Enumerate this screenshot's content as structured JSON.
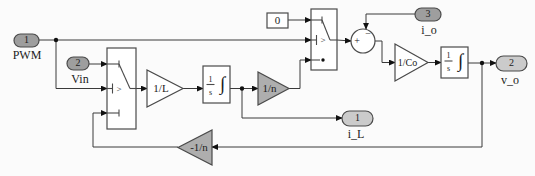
{
  "colors": {
    "wire": "#3a3a3a",
    "block_border": "#4a4a4a",
    "input_port_fill": "#9e9e9e",
    "output_port_fill": "#cbcbcb",
    "gain_gray_fill": "#aeaeae",
    "background": "#fbfbfb"
  },
  "ports": {
    "pwm": {
      "number": "1",
      "label": "PWM"
    },
    "vin": {
      "number": "2",
      "label": "Vin"
    },
    "i_o": {
      "number": "3",
      "label": "i_o"
    },
    "i_l": {
      "number": "1",
      "label": "i_L"
    },
    "v_o": {
      "number": "2",
      "label": "v_o"
    }
  },
  "blocks": {
    "constant": {
      "value": "0"
    },
    "gain_1L": {
      "label": "1/L"
    },
    "gain_1n": {
      "label": "1/n"
    },
    "gain_neg1n": {
      "label": "-1/n"
    },
    "gain_1Co": {
      "label": "1/Co"
    },
    "integrator": {
      "num": "1",
      "den": "s",
      "sign": "∫"
    },
    "switch": {
      "criteria": ">"
    },
    "sum": {
      "plus": "+",
      "minus": "−"
    }
  }
}
